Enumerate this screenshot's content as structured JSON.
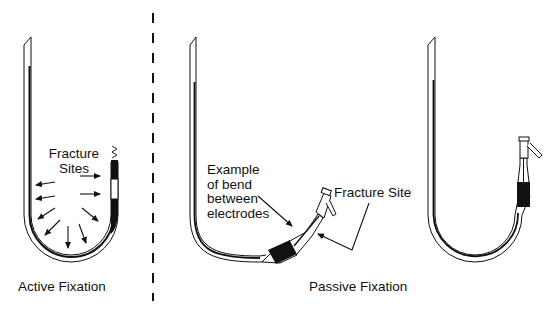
{
  "figure": {
    "divider_style": "dashed",
    "colors": {
      "ink": "#111111",
      "background": "#ffffff"
    },
    "panels": [
      {
        "id": "active",
        "caption": "Active Fixation",
        "annotations": {
          "fracture_sites_line1": "Fracture",
          "fracture_sites_line2": "Sites"
        },
        "arrow_count": 9
      },
      {
        "id": "passive-bent",
        "annotations": {
          "bend_line1": "Example",
          "bend_line2": "of bend",
          "bend_line3": "between",
          "bend_line4": "electrodes",
          "fracture_site": "Fracture Site"
        }
      },
      {
        "id": "passive-straight"
      }
    ],
    "passive_caption": "Passive Fixation"
  }
}
